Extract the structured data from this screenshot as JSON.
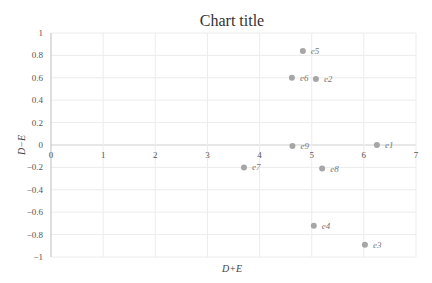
{
  "chart_data": {
    "type": "scatter",
    "title": "Chart title",
    "xlabel": "D+E",
    "ylabel": "D−E",
    "xlim": [
      0,
      7
    ],
    "ylim": [
      -1,
      1
    ],
    "x_ticks": [
      0,
      1,
      2,
      3,
      4,
      5,
      6,
      7
    ],
    "y_ticks": [
      1,
      0.8,
      0.6,
      0.4,
      0.2,
      0,
      -0.2,
      -0.4,
      -0.6,
      -0.8,
      -1
    ],
    "y_tick_labels": [
      "1",
      "0.8",
      "0.6",
      "0.4",
      "0.2",
      "0",
      "−0.2",
      "−0.4",
      "−0.6",
      "−0.8",
      "−1"
    ],
    "grid": true,
    "legend": false,
    "marker_color": "#a6a6a6",
    "series": [
      {
        "name": "points",
        "points": [
          {
            "label": "e1",
            "x": 6.25,
            "y": 0.0
          },
          {
            "label": "e2",
            "x": 5.08,
            "y": 0.59
          },
          {
            "label": "e3",
            "x": 6.02,
            "y": -0.89
          },
          {
            "label": "e4",
            "x": 5.04,
            "y": -0.72
          },
          {
            "label": "e5",
            "x": 4.83,
            "y": 0.84
          },
          {
            "label": "e6",
            "x": 4.62,
            "y": 0.6
          },
          {
            "label": "e7",
            "x": 3.7,
            "y": -0.2
          },
          {
            "label": "e8",
            "x": 5.2,
            "y": -0.21
          },
          {
            "label": "e9",
            "x": 4.63,
            "y": -0.01
          }
        ]
      }
    ]
  }
}
